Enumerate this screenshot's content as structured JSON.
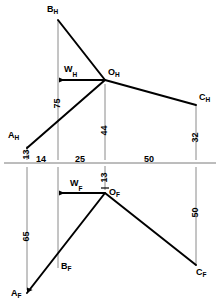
{
  "diagram": {
    "type": "orthographic-projection",
    "reference_line_y": 163,
    "views": {
      "horizontal": {
        "suffix": "H",
        "label": "H"
      },
      "frontal": {
        "suffix": "F",
        "label": "F"
      }
    },
    "points": [
      {
        "name": "B_H",
        "base": "B",
        "sub": "H",
        "x": 58,
        "y": 20,
        "label_x": 47,
        "label_y": 5
      },
      {
        "name": "O_H",
        "base": "O",
        "sub": "H",
        "x": 105,
        "y": 80,
        "label_x": 108,
        "label_y": 68
      },
      {
        "name": "A_H",
        "base": "A",
        "sub": "H",
        "x": 27,
        "y": 148,
        "label_x": 8,
        "label_y": 131
      },
      {
        "name": "C_H",
        "base": "C",
        "sub": "H",
        "x": 196,
        "y": 105,
        "label_x": 199,
        "label_y": 93
      },
      {
        "name": "O_F",
        "base": "O",
        "sub": "F",
        "x": 105,
        "y": 193,
        "label_x": 109,
        "label_y": 188
      },
      {
        "name": "B_F",
        "base": "B",
        "sub": "F",
        "x": 58,
        "y": 265,
        "label_x": 61,
        "label_y": 262
      },
      {
        "name": "A_F",
        "base": "A",
        "sub": "F",
        "x": 27,
        "y": 293,
        "label_x": 11,
        "label_y": 289
      },
      {
        "name": "C_F",
        "base": "C",
        "sub": "F",
        "x": 196,
        "y": 265,
        "label_x": 196,
        "label_y": 268
      }
    ],
    "force_vectors": [
      {
        "name": "W_H",
        "base": "W",
        "sub": "H",
        "from_x": 105,
        "to_x": 58,
        "y": 80,
        "label_x": 64,
        "label_y": 65
      },
      {
        "name": "W_F",
        "base": "W",
        "sub": "F",
        "from_x": 105,
        "to_x": 58,
        "y": 193,
        "label_x": 70,
        "label_y": 179
      }
    ],
    "horizontal_dimensions": [
      {
        "value": "14",
        "x_from": 27,
        "x_to": 58,
        "label_x": 36,
        "label_y": 155
      },
      {
        "value": "25",
        "x_from": 58,
        "x_to": 105,
        "label_x": 75,
        "label_y": 155
      },
      {
        "value": "50",
        "x_from": 105,
        "x_to": 196,
        "label_x": 144,
        "label_y": 155
      }
    ],
    "vertical_dimensions": [
      {
        "value": "13",
        "x": 27,
        "label_x": 22,
        "label_y": 152,
        "note": "A_H offset above reference line"
      },
      {
        "value": "13",
        "x": 105,
        "label_x": 100,
        "label_y": 175,
        "note": "O_F offset below reference line"
      },
      {
        "value": "75",
        "x": 58,
        "label_x": 53,
        "label_y": 101,
        "note": "B_H to reference line"
      },
      {
        "value": "44",
        "x": 105,
        "label_x": 100,
        "label_y": 128,
        "note": "O_H to reference line"
      },
      {
        "value": "32",
        "x": 196,
        "label_x": 191,
        "label_y": 135,
        "note": "C_H to reference line"
      },
      {
        "value": "65",
        "x": 27,
        "label_x": 22,
        "label_y": 234,
        "note": "A_F below reference line"
      },
      {
        "value": "50",
        "x": 196,
        "label_x": 191,
        "label_y": 210,
        "note": "C_F below reference line"
      }
    ],
    "units": "mm"
  },
  "colors": {
    "ink": "#000000",
    "thin_line": "#808080",
    "background": "#ffffff"
  }
}
